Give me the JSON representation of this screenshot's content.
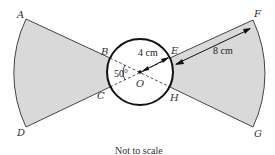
{
  "diagram": {
    "type": "geometry-figure",
    "points": {
      "A": "A",
      "B": "B",
      "C": "C",
      "D": "D",
      "E": "E",
      "F": "F",
      "G": "G",
      "H": "H",
      "O": "O"
    },
    "measurements": {
      "radius_small": "4 cm",
      "segment_EF": "8 cm",
      "angle_BOC": "50°"
    },
    "caption": "Not to scale",
    "colors": {
      "sector_fill": "#d9d9d9",
      "stroke": "#333333",
      "circle_stroke": "#111111"
    }
  }
}
